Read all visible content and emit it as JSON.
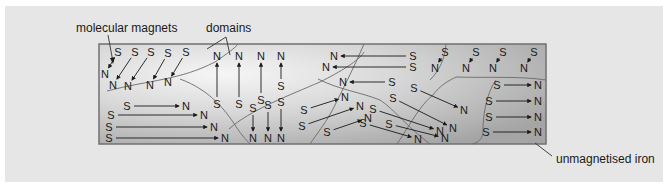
{
  "labels": {
    "molecular_magnets": "molecular magnets",
    "domains": "domains",
    "unmagnetised_iron": "unmagnetised iron"
  },
  "colors": {
    "panel_bg": "#e6e6e6",
    "bar_light": "#f4f4f4",
    "bar_dark": "#a9a9a9",
    "bar_border": "#707070",
    "text": "#1a1a1a"
  },
  "bar": {
    "x": 99,
    "y": 44,
    "width": 447,
    "height": 100
  },
  "pole_labels": {
    "north": "N",
    "south": "S"
  },
  "magnets": [
    {
      "s": [
        118,
        52
      ],
      "n": [
        105,
        74
      ]
    },
    {
      "s": [
        135,
        52
      ],
      "n": [
        113,
        85
      ]
    },
    {
      "s": [
        151,
        52
      ],
      "n": [
        128,
        86
      ]
    },
    {
      "s": [
        168,
        53
      ],
      "n": [
        150,
        85
      ]
    },
    {
      "s": [
        186,
        52
      ],
      "n": [
        168,
        82
      ]
    },
    {
      "s": [
        217,
        104
      ],
      "n": [
        217,
        56
      ]
    },
    {
      "s": [
        239,
        104
      ],
      "n": [
        239,
        56
      ]
    },
    {
      "s": [
        261,
        100
      ],
      "n": [
        261,
        56
      ]
    },
    {
      "s": [
        281,
        86
      ],
      "n": [
        281,
        56
      ]
    },
    {
      "s": [
        127,
        106
      ],
      "n": [
        186,
        106
      ]
    },
    {
      "s": [
        111,
        115
      ],
      "n": [
        204,
        115
      ]
    },
    {
      "s": [
        109,
        127
      ],
      "n": [
        214,
        127
      ]
    },
    {
      "s": [
        109,
        138
      ],
      "n": [
        225,
        138
      ]
    },
    {
      "s": [
        253,
        108
      ],
      "n": [
        253,
        138
      ]
    },
    {
      "s": [
        268,
        105
      ],
      "n": [
        268,
        138
      ]
    },
    {
      "s": [
        281,
        102
      ],
      "n": [
        281,
        138
      ]
    },
    {
      "s": [
        413,
        56
      ],
      "n": [
        334,
        56
      ]
    },
    {
      "s": [
        413,
        67
      ],
      "n": [
        326,
        67
      ]
    },
    {
      "s": [
        392,
        82
      ],
      "n": [
        343,
        82
      ]
    },
    {
      "s": [
        304,
        110
      ],
      "n": [
        345,
        97
      ]
    },
    {
      "s": [
        302,
        126
      ],
      "n": [
        360,
        106
      ]
    },
    {
      "s": [
        327,
        132
      ],
      "n": [
        368,
        118
      ]
    },
    {
      "s": [
        445,
        52
      ],
      "n": [
        435,
        68
      ]
    },
    {
      "s": [
        476,
        52
      ],
      "n": [
        466,
        68
      ]
    },
    {
      "s": [
        503,
        52
      ],
      "n": [
        493,
        68
      ]
    },
    {
      "s": [
        534,
        52
      ],
      "n": [
        524,
        68
      ]
    },
    {
      "s": [
        414,
        88
      ],
      "n": [
        464,
        110
      ]
    },
    {
      "s": [
        393,
        98
      ],
      "n": [
        453,
        128
      ]
    },
    {
      "s": [
        373,
        109
      ],
      "n": [
        440,
        131
      ]
    },
    {
      "s": [
        363,
        123
      ],
      "n": [
        418,
        139
      ]
    },
    {
      "s": [
        389,
        124
      ],
      "n": [
        445,
        138
      ]
    },
    {
      "s": [
        497,
        85
      ],
      "n": [
        538,
        85
      ]
    },
    {
      "s": [
        489,
        101
      ],
      "n": [
        538,
        101
      ]
    },
    {
      "s": [
        489,
        117
      ],
      "n": [
        538,
        117
      ]
    },
    {
      "s": [
        486,
        132
      ],
      "n": [
        538,
        132
      ]
    }
  ],
  "domain_boundaries": [
    "M 107 91 C 150 80, 180 80, 215 62 C 228 53, 235 48, 238 44",
    "M 180 79 C 210 90, 225 110, 235 125 C 240 133, 246 140, 250 144",
    "M 229 129 C 250 110, 290 95, 320 82 C 340 72, 360 60, 364 52",
    "M 364 44 C 355 65, 345 85, 335 105 C 328 120, 316 135, 310 144",
    "M 318 79 C 340 90, 360 92, 380 100 C 395 110, 405 125, 430 144",
    "M 397 144 C 410 125, 420 105, 433 95 C 440 85, 450 80, 456 77 C 490 78, 520 76, 546 80",
    "M 430 80 C 440 70, 445 58, 446 44",
    "M 496 80 C 485 95, 483 120, 483 130 C 483 138, 480 142, 472 144"
  ]
}
